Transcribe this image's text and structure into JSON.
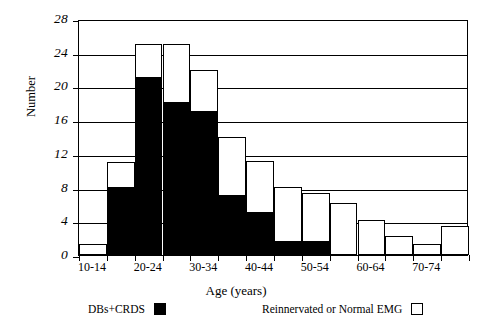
{
  "chart_data": {
    "type": "bar",
    "stacked": true,
    "title": "",
    "xlabel": "Age (years)",
    "ylabel": "Number",
    "ylim": [
      0,
      28
    ],
    "ytick_values": [
      0,
      4,
      8,
      12,
      16,
      20,
      24,
      28
    ],
    "ytick_labels": [
      "0",
      "4",
      "8",
      "12",
      "16",
      "20",
      "24",
      "28"
    ],
    "grid": "horizontal",
    "legend_position": "below-axes",
    "categories": [
      "10-14",
      "15-19",
      "20-24",
      "25-29",
      "30-34",
      "35-39",
      "40-44",
      "45-49",
      "50-54",
      "55-59",
      "60-64",
      "65-69",
      "70-74",
      "75-79"
    ],
    "xtick_labels_shown": [
      "10-14",
      "20-24",
      "30-34",
      "40-44",
      "50-54",
      "60-64",
      "70-74"
    ],
    "series": [
      {
        "name": "DBs+CRDS",
        "color": "#000000",
        "values": [
          0,
          8,
          21,
          18,
          17,
          7,
          5,
          1.5,
          1.5,
          0,
          0,
          0,
          0,
          0
        ]
      },
      {
        "name": "Reinnervated or Normal EMG",
        "color": "#ffffff",
        "values": [
          1.3,
          3,
          4,
          7,
          5,
          7,
          6.2,
          6.6,
          5.8,
          6.2,
          4.2,
          2.3,
          1.3,
          3.4
        ]
      }
    ],
    "totals": [
      1.3,
      11,
      25,
      25,
      22,
      14,
      11.2,
      8.1,
      7.3,
      6.2,
      4.2,
      2.3,
      1.3,
      3.4
    ]
  },
  "axes": {
    "y_title": "Number",
    "x_title": "Age (years)"
  },
  "legend": {
    "entries": [
      {
        "label": "DBs+CRDS",
        "swatch": "black"
      },
      {
        "label": "Reinnervated or Normal EMG",
        "swatch": "white"
      }
    ]
  }
}
